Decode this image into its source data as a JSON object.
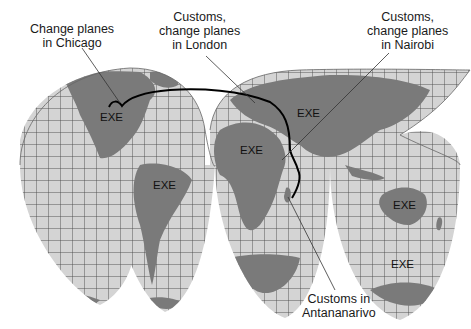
{
  "map": {
    "projection": "interrupted-goode-homolosine",
    "colors": {
      "ocean": "#d4d4d4",
      "land": "#7a7a7a",
      "grid": "#4a4a4a",
      "route": "#000000",
      "leader": "#333333"
    },
    "region_labels": [
      {
        "id": "north-america",
        "text": "EXE"
      },
      {
        "id": "south-america",
        "text": "EXE"
      },
      {
        "id": "africa",
        "text": "EXE"
      },
      {
        "id": "asia",
        "text": "EXE"
      },
      {
        "id": "australia",
        "text": "EXE"
      },
      {
        "id": "antarctica",
        "text": "EXE"
      }
    ],
    "callouts": [
      {
        "id": "chicago",
        "lines": [
          "Change planes",
          "in Chicago"
        ]
      },
      {
        "id": "london",
        "lines": [
          "Customs,",
          "change planes",
          "in London"
        ]
      },
      {
        "id": "nairobi",
        "lines": [
          "Customs,",
          "change planes",
          "in Nairobi"
        ]
      },
      {
        "id": "antananarivo",
        "lines": [
          "Customs in",
          "Antananarivo"
        ]
      }
    ],
    "route_stops": [
      "Chicago",
      "London",
      "Nairobi",
      "Antananarivo"
    ]
  }
}
